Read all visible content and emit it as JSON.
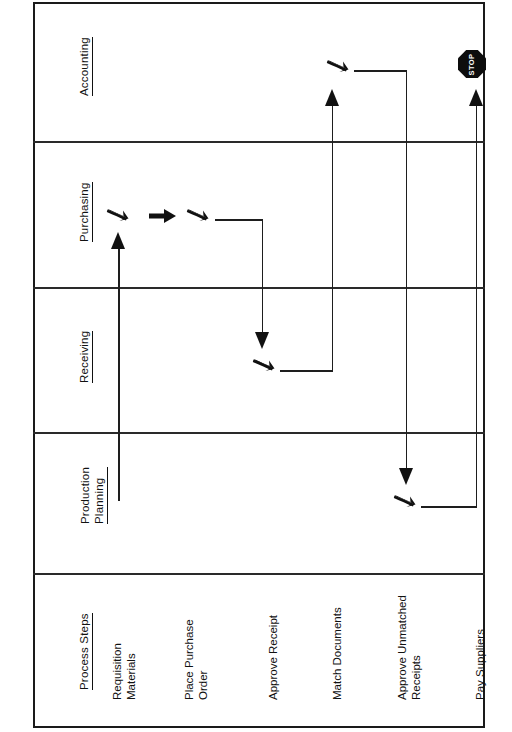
{
  "diagram": {
    "orientation": "rotated-90-ccw",
    "colors": {
      "ink": "#111111",
      "rule": "#2a2a2a",
      "paper": "#ffffff"
    },
    "lanes": [
      {
        "id": "accounting",
        "label": "Accounting",
        "lines": [
          "Accounting"
        ],
        "underlined": [
          "Accounting"
        ]
      },
      {
        "id": "purchasing",
        "label": "Purchasing",
        "lines": [
          "Purchasing"
        ],
        "underlined": [
          "Purchasing"
        ]
      },
      {
        "id": "receiving",
        "label": "Receiving",
        "lines": [
          "Receiving"
        ],
        "underlined": [
          "Receiving"
        ]
      },
      {
        "id": "production-planning",
        "label": "Production Planning",
        "lines": [
          "Production",
          "Planning"
        ],
        "underlined": [
          "Planning"
        ]
      },
      {
        "id": "process-steps",
        "label": "Process  Steps",
        "lines": [
          "Process  Steps"
        ],
        "underlined": [
          "Process  Steps"
        ]
      }
    ],
    "steps": [
      {
        "id": "requisition-materials",
        "lines": [
          "Requisition",
          "Materials"
        ],
        "lane": "purchasing"
      },
      {
        "id": "place-purchase-order",
        "lines": [
          "Place  Purchase",
          "Order"
        ],
        "lane": "purchasing"
      },
      {
        "id": "approve-receipt",
        "lines": [
          "Approve Receipt"
        ],
        "lane": "receiving"
      },
      {
        "id": "match-documents",
        "lines": [
          "Match Documents"
        ],
        "lane": "accounting"
      },
      {
        "id": "approve-unmatched",
        "lines": [
          "Approve Unmatched",
          "Receipts"
        ],
        "lane": "production-planning"
      },
      {
        "id": "pay-suppliers",
        "lines": [
          "Pay Suppliers"
        ],
        "lane": "accounting"
      }
    ],
    "terminator": {
      "id": "stop",
      "label": "STOP",
      "shape": "octagon",
      "fill": "#0d0d0d",
      "text_color": "#ffffff"
    },
    "glyphs": {
      "node": "bent-arrow-icon",
      "straight": "right-arrow-icon",
      "arrowhead_up": "arrowhead-up-icon",
      "arrowhead_down": "arrowhead-down-icon"
    }
  }
}
